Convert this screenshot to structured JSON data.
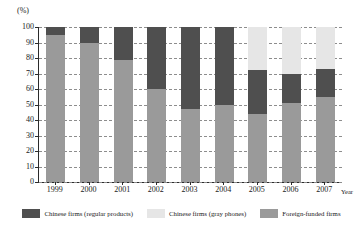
{
  "chart_data": {
    "type": "bar",
    "subtype": "stacked-100-percent",
    "title": "",
    "xlabel": "Year",
    "ylabel": "(%)",
    "ylim": [
      0,
      100
    ],
    "ytick_step": 10,
    "yticks": [
      "100",
      "90",
      "80",
      "70",
      "60",
      "50",
      "40",
      "30",
      "20",
      "10",
      "0"
    ],
    "grid": true,
    "grid_style": "dashed-horizontal",
    "legend_position": "bottom-center",
    "categories": [
      "1999",
      "2000",
      "2001",
      "2002",
      "2003",
      "2004",
      "2005",
      "2006",
      "2007"
    ],
    "series": [
      {
        "name": "Foreign-funded firms",
        "color": "#9a9a9a",
        "values": [
          95,
          90,
          79,
          60,
          47,
          50,
          44,
          51,
          55
        ]
      },
      {
        "name": "Chinese firms (regular products)",
        "color": "#4f4f4f",
        "values": [
          5,
          10,
          21,
          40,
          53,
          50,
          28,
          19,
          18
        ]
      },
      {
        "name": "Chinese firms (gray phones)",
        "color": "#e6e6e6",
        "values": [
          0,
          0,
          0,
          0,
          0,
          0,
          28,
          30,
          27
        ]
      }
    ],
    "stack_order_bottom_to_top": [
      "Foreign-funded firms",
      "Chinese firms (regular products)",
      "Chinese firms (gray phones)"
    ]
  },
  "axes": {
    "unit_label": "(%)",
    "x_axis_title": "Year",
    "y_tick_labels": [
      "100",
      "90",
      "80",
      "70",
      "60",
      "50",
      "40",
      "30",
      "20",
      "10",
      "0"
    ],
    "x_tick_labels": [
      "1999",
      "2000",
      "2001",
      "2002",
      "2003",
      "2004",
      "2005",
      "2006",
      "2007"
    ]
  },
  "legend": {
    "items": [
      {
        "label": "Chinese firms (regular products)",
        "color": "#4f4f4f"
      },
      {
        "label": "Chinese firms (gray phones)",
        "color": "#e6e6e6"
      },
      {
        "label": "Foreign-funded firms",
        "color": "#9a9a9a"
      }
    ]
  },
  "colors": {
    "regular": "#4f4f4f",
    "gray_phones": "#e6e6e6",
    "foreign": "#9a9a9a",
    "axis": "#2b2b2b",
    "grid": "#8d8d8d",
    "background": "#ffffff"
  }
}
